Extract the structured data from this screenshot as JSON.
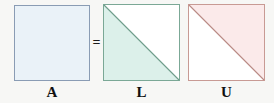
{
  "figure": {
    "type": "lu-decomposition-diagram",
    "background_color": "#f7f7f5",
    "relation_symbol": "="
  },
  "matrices": [
    {
      "id": "a",
      "label": "A",
      "shape": "full-square",
      "fill_color": "#eaf2f8",
      "border_color": "#8a9cb4",
      "triangle_fill": "",
      "diagonal": "none"
    },
    {
      "id": "l",
      "label": "L",
      "shape": "lower-triangular",
      "fill_color": "#ffffff",
      "border_color": "#7ba896",
      "triangle_fill": "#dcf0ea",
      "diagonal": "top-left-to-bottom-right"
    },
    {
      "id": "u",
      "label": "U",
      "shape": "upper-triangular",
      "fill_color": "#ffffff",
      "border_color": "#c89a94",
      "triangle_fill": "#fbeaea",
      "diagonal": "top-left-to-bottom-right"
    }
  ]
}
